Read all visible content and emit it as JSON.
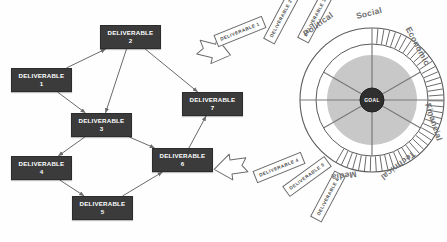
{
  "canvas": {
    "width": 447,
    "height": 242,
    "background": "#fefefe"
  },
  "palette": {
    "box_fill": "#3b3b3b",
    "box_text": "#ffffff",
    "connector": "#6a6a6a",
    "tag_stroke": "#6b6b6b",
    "wheel_stroke": "#5a5a5a",
    "wheel_inner_fill": "#c8c8c8",
    "hub_fill": "#2f2f2f",
    "label_text": "#6f6f6f"
  },
  "network": {
    "title": "Deliverable dependency network",
    "nodes": [
      {
        "id": "d1",
        "line1": "DELIVERABLE",
        "line2": "1",
        "x": 11,
        "y": 68,
        "w": 61,
        "h": 24
      },
      {
        "id": "d2",
        "line1": "DELIVERABLE",
        "line2": "2",
        "x": 100,
        "y": 25,
        "w": 61,
        "h": 24
      },
      {
        "id": "d3",
        "line1": "DELIVERABLE",
        "line2": "3",
        "x": 71,
        "y": 113,
        "w": 61,
        "h": 24
      },
      {
        "id": "d4",
        "line1": "DELIVERABLE",
        "line2": "4",
        "x": 11,
        "y": 156,
        "w": 61,
        "h": 24
      },
      {
        "id": "d5",
        "line1": "DELIVERABLE",
        "line2": "5",
        "x": 72,
        "y": 196,
        "w": 61,
        "h": 24
      },
      {
        "id": "d6",
        "line1": "DELIVERABLE",
        "line2": "6",
        "x": 152,
        "y": 148,
        "w": 61,
        "h": 24
      },
      {
        "id": "d7",
        "line1": "DELIVERABLE",
        "line2": "7",
        "x": 182,
        "y": 92,
        "w": 61,
        "h": 24
      }
    ],
    "edges": [
      {
        "from": "d1",
        "to": "d2"
      },
      {
        "from": "d1",
        "to": "d3"
      },
      {
        "from": "d2",
        "to": "d3"
      },
      {
        "from": "d2",
        "to": "d7"
      },
      {
        "from": "d3",
        "to": "d4"
      },
      {
        "from": "d3",
        "to": "d6"
      },
      {
        "from": "d4",
        "to": "d5"
      },
      {
        "from": "d5",
        "to": "d6"
      },
      {
        "from": "d6",
        "to": "d7"
      }
    ]
  },
  "tags": [
    {
      "label": "DELIVERABLE 1",
      "x": 214,
      "y": 25,
      "w": 52,
      "h": 13,
      "rotate": -22
    },
    {
      "label": "DELIVERABLE 2",
      "x": 255,
      "y": 12,
      "w": 52,
      "h": 13,
      "rotate": -62
    },
    {
      "label": "DELIVERABLE 3",
      "x": 289,
      "y": 11,
      "w": 52,
      "h": 13,
      "rotate": -62
    },
    {
      "label": "DELIVERABLE 4",
      "x": 253,
      "y": 161,
      "w": 52,
      "h": 13,
      "rotate": -22
    },
    {
      "label": "DELIVERABLE 5",
      "x": 281,
      "y": 170,
      "w": 52,
      "h": 13,
      "rotate": -36
    },
    {
      "label": "DELIVERABLE 6",
      "x": 302,
      "y": 190,
      "w": 52,
      "h": 13,
      "rotate": -62
    }
  ],
  "arrows": [
    {
      "name": "flow-arrow-top",
      "points": "198,44 214,44 214,38 231,51 214,64 214,58 198,58 203,51",
      "rotate": 14,
      "cx": 214,
      "cy": 51
    },
    {
      "name": "flow-arrow-bottom",
      "points": "247,160 231,160 231,154 214,167 231,180 231,174 247,174 242,167",
      "rotate": -8,
      "cx": 231,
      "cy": 167
    }
  ],
  "wheel": {
    "center_x": 372,
    "center_y": 100,
    "outer_radius": 72,
    "ring_inner_radius": 56,
    "inner_fill_radius": 45,
    "hub_radius": 12,
    "hub_label": "GOAL",
    "tick_count": 44,
    "tick_start_angle": -90,
    "tick_end_angle": 120,
    "sectors": [
      {
        "label": "Political",
        "x": 318,
        "y": 24,
        "rotate": -36
      },
      {
        "label": "Social",
        "x": 369,
        "y": 13,
        "rotate": -14
      },
      {
        "label": "Economic",
        "x": 418,
        "y": 46,
        "rotate": 62
      },
      {
        "label": "Financial",
        "x": 434,
        "y": 122,
        "rotate": 72
      },
      {
        "label": "Technical",
        "x": 398,
        "y": 166,
        "rotate": 142
      },
      {
        "label": "Media",
        "x": 344,
        "y": 176,
        "rotate": 172
      }
    ],
    "spoke_count": 6
  }
}
